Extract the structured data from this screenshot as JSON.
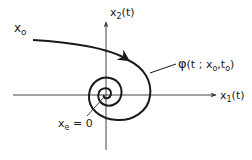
{
  "diagram": {
    "type": "phase-portrait",
    "axes": {
      "x_axis_label": "x",
      "x_axis_sub": "1",
      "x_axis_suffix": "(t)",
      "y_axis_label": "x",
      "y_axis_sub": "2",
      "y_axis_suffix": "(t)"
    },
    "labels": {
      "initial_state": "x",
      "initial_state_sub": "o",
      "trajectory_phi": "φ",
      "trajectory_args_pre": "(t ; x",
      "trajectory_sub1": "o",
      "trajectory_comma": ",t",
      "trajectory_sub2": "o",
      "trajectory_close": ")",
      "equilibrium": "x",
      "equilibrium_sub": "e",
      "equilibrium_eq": " = 0"
    },
    "colors": {
      "stroke": "#1a1a1a",
      "axis": "#333333",
      "background": "#ffffff"
    }
  }
}
